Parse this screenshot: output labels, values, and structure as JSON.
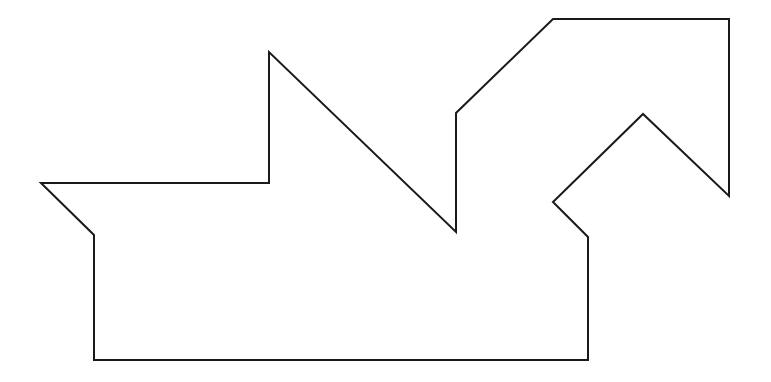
{
  "diagram": {
    "type": "polygon-outline",
    "stroke_color": "#1a1a1a",
    "fill_color": "#ffffff",
    "background": "#ffffff",
    "stroke_width": 2,
    "points": [
      [
        41,
        183
      ],
      [
        269,
        183
      ],
      [
        269,
        52
      ],
      [
        456,
        232
      ],
      [
        456,
        113
      ],
      [
        553,
        19
      ],
      [
        729,
        19
      ],
      [
        729,
        196
      ],
      [
        643,
        114
      ],
      [
        553,
        202
      ],
      [
        588,
        237
      ],
      [
        588,
        360
      ],
      [
        94,
        360
      ],
      [
        94,
        235
      ]
    ]
  }
}
